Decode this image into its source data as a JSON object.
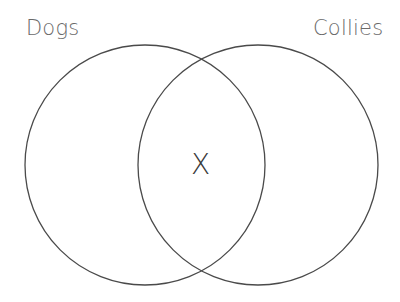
{
  "diagram": {
    "type": "venn",
    "sets": [
      {
        "label": "Dogs",
        "cx": 145,
        "cy": 165,
        "r": 120
      },
      {
        "label": "Collies",
        "cx": 258,
        "cy": 165,
        "r": 120
      }
    ],
    "intersection_mark": "X",
    "stroke_color": "#4a4a4a",
    "label_color": "#6a6a6a"
  }
}
